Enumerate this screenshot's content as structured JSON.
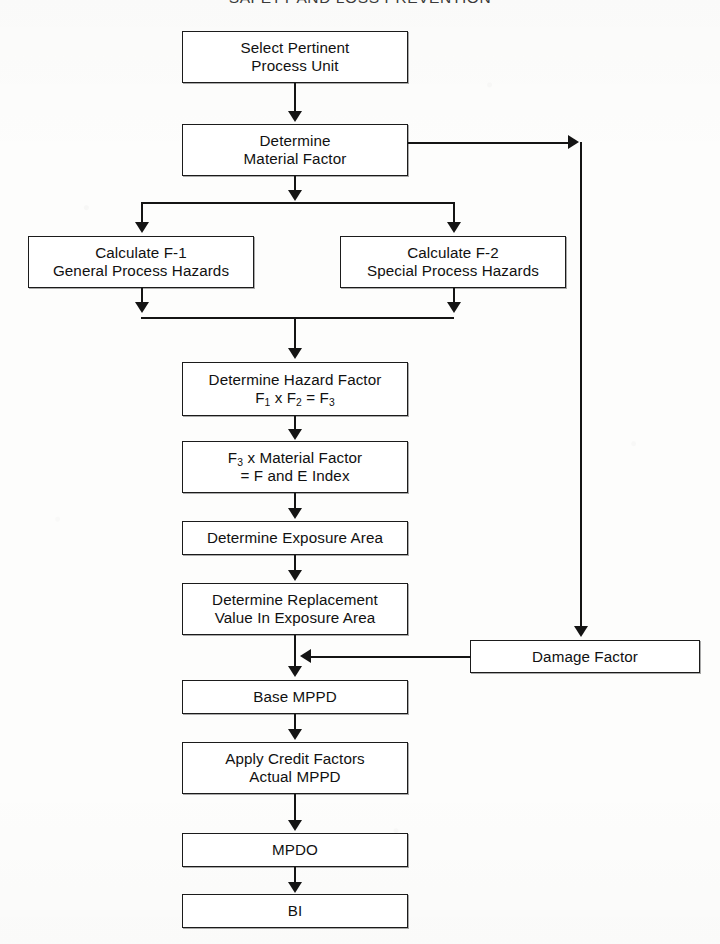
{
  "page": {
    "running_header": "SAFETY AND LOSS PREVENTION",
    "width": 720,
    "height": 944,
    "ink_color": "#141414",
    "paper_color": "#fdfdfc"
  },
  "chart_data": {
    "type": "diagram",
    "diagram_kind": "flowchart",
    "title": "SAFETY AND LOSS PREVENTION",
    "orientation": "top-to-bottom",
    "nodes": [
      {
        "id": "select_unit",
        "label": "Select Pertinent\nProcess Unit",
        "x": 182,
        "y": 31,
        "w": 226,
        "h": 52
      },
      {
        "id": "material_factor",
        "label": "Determine\nMaterial Factor",
        "x": 182,
        "y": 124,
        "w": 226,
        "h": 52
      },
      {
        "id": "calc_f1",
        "label": "Calculate F-1\nGeneral Process Hazards",
        "x": 28,
        "y": 236,
        "w": 226,
        "h": 52
      },
      {
        "id": "calc_f2",
        "label": "Calculate F-2\nSpecial Process Hazards",
        "x": 340,
        "y": 236,
        "w": 226,
        "h": 52
      },
      {
        "id": "hazard_factor",
        "label": "Determine Hazard Factor\nF1 x F2 = F3",
        "x": 182,
        "y": 362,
        "w": 226,
        "h": 54,
        "label_html": "Determine Hazard Factor<br>F<sub>1</sub> x F<sub>2</sub> = F<sub>3</sub>"
      },
      {
        "id": "fe_index",
        "label": "F3 x Material Factor\n= F and E Index",
        "x": 182,
        "y": 441,
        "w": 226,
        "h": 52,
        "label_html": "F<sub>3</sub> x Material Factor<br>= F and E Index"
      },
      {
        "id": "exposure_area",
        "label": "Determine Exposure Area",
        "x": 182,
        "y": 521,
        "w": 226,
        "h": 34
      },
      {
        "id": "replacement_value",
        "label": "Determine Replacement\nValue In Exposure Area",
        "x": 182,
        "y": 583,
        "w": 226,
        "h": 52
      },
      {
        "id": "damage_factor",
        "label": "Damage Factor",
        "x": 470,
        "y": 640,
        "w": 230,
        "h": 33
      },
      {
        "id": "base_mppd",
        "label": "Base MPPD",
        "x": 182,
        "y": 680,
        "w": 226,
        "h": 34
      },
      {
        "id": "credit_factors",
        "label": "Apply Credit Factors\nActual MPPD",
        "x": 182,
        "y": 742,
        "w": 226,
        "h": 52
      },
      {
        "id": "mpdo",
        "label": "MPDO",
        "x": 182,
        "y": 833,
        "w": 226,
        "h": 34
      },
      {
        "id": "bi",
        "label": "BI",
        "x": 182,
        "y": 894,
        "w": 226,
        "h": 34
      }
    ],
    "edges": [
      {
        "from": "select_unit",
        "to": "material_factor",
        "style": "straight-down"
      },
      {
        "from": "material_factor",
        "to": "split",
        "style": "straight-down"
      },
      {
        "from": "split",
        "to": "calc_f1",
        "style": "elbow-left"
      },
      {
        "from": "split",
        "to": "calc_f2",
        "style": "elbow-right"
      },
      {
        "from": "calc_f1",
        "to": "merge",
        "style": "elbow-right"
      },
      {
        "from": "calc_f2",
        "to": "merge",
        "style": "elbow-left"
      },
      {
        "from": "merge",
        "to": "hazard_factor",
        "style": "straight-down"
      },
      {
        "from": "hazard_factor",
        "to": "fe_index",
        "style": "straight-down"
      },
      {
        "from": "fe_index",
        "to": "exposure_area",
        "style": "straight-down"
      },
      {
        "from": "exposure_area",
        "to": "replacement_value",
        "style": "straight-down"
      },
      {
        "from": "replacement_value",
        "to": "base_mppd",
        "style": "straight-down"
      },
      {
        "from": "material_factor",
        "to": "damage_factor",
        "style": "right-then-down"
      },
      {
        "from": "damage_factor",
        "to": "base_mppd",
        "style": "left-into-trunk"
      },
      {
        "from": "base_mppd",
        "to": "credit_factors",
        "style": "straight-down"
      },
      {
        "from": "credit_factors",
        "to": "mpdo",
        "style": "straight-down"
      },
      {
        "from": "mpdo",
        "to": "bi",
        "style": "straight-down"
      }
    ]
  }
}
